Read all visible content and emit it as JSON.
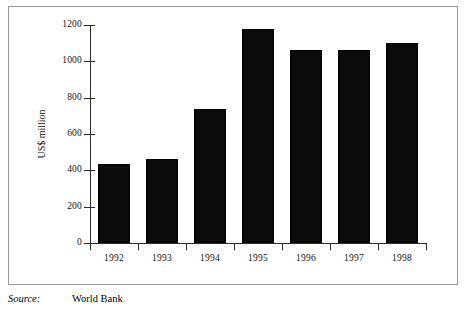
{
  "figure": {
    "frame_visible": true,
    "border_color": "#9a9a9a",
    "background": "#ffffff"
  },
  "source": {
    "label": "Source:",
    "value": "World Bank"
  },
  "chart_data": {
    "type": "bar",
    "title": "",
    "xlabel": "",
    "ylabel": "US$ million",
    "categories": [
      "1992",
      "1993",
      "1994",
      "1995",
      "1996",
      "1997",
      "1998"
    ],
    "values": [
      437,
      460,
      735,
      1180,
      1065,
      1060,
      1100
    ],
    "ylim": [
      0,
      1200
    ],
    "yticks": [
      "0",
      "200",
      "400",
      "600",
      "800",
      "1000",
      "1200"
    ],
    "ytick_values": [
      0,
      200,
      400,
      600,
      800,
      1000,
      1200
    ],
    "grid": false,
    "legend": false,
    "bar_color": "#0b0b0b",
    "axis_color": "#2b2b2b"
  }
}
